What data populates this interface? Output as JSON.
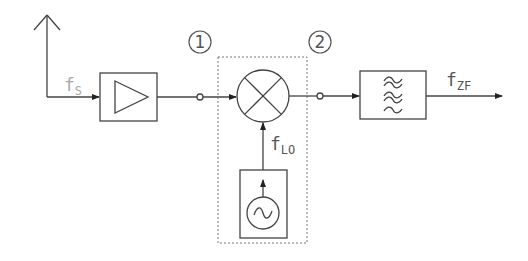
{
  "diagram": {
    "type": "block-diagram",
    "labels": {
      "signal_in": {
        "main": "f",
        "sub": "S"
      },
      "local_osc": {
        "main": "f",
        "sub": "LO"
      },
      "if_out": {
        "main": "f",
        "sub": "ZF"
      },
      "node_1": "1",
      "node_2": "2"
    },
    "blocks": [
      {
        "id": "antenna",
        "label": "Antenna"
      },
      {
        "id": "amplifier",
        "label": "Amplifier",
        "symbol": "triangle"
      },
      {
        "id": "mixer",
        "label": "Mixer",
        "symbol": "circle-x"
      },
      {
        "id": "oscillator",
        "label": "Local Oscillator",
        "symbol": "~"
      },
      {
        "id": "bandpass-filter",
        "label": "Bandpass Filter",
        "symbol": "≈≈≈"
      }
    ],
    "symbols": {
      "oscillator_glyph": "~",
      "filter_glyph": "≈"
    },
    "colors": {
      "stroke": "#444444",
      "label": "#555555",
      "faint_label": "#aaaaaa",
      "dashed": "#777777"
    }
  }
}
